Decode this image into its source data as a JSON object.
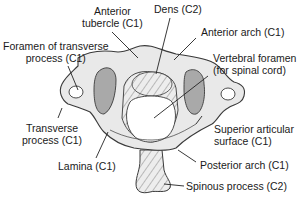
{
  "diagram": {
    "labels": {
      "anterior_tubercle": [
        "Anterior",
        "tubercle (C1)"
      ],
      "dens": [
        "Dens (C2)"
      ],
      "anterior_arch": [
        "Anterior arch (C1)"
      ],
      "foramen_transverse": [
        "Foramen of transverse",
        "process (C1)"
      ],
      "vertebral_foramen": [
        "Vertebral foramen",
        "(for spinal cord)"
      ],
      "transverse_process": [
        "Transverse",
        "process (C1)"
      ],
      "superior_articular": [
        "Superior articular",
        "surface (C1)"
      ],
      "lamina": [
        "Lamina (C1)"
      ],
      "posterior_arch": [
        "Posterior arch (C1)"
      ],
      "spinous_process": [
        "Spinous process (C2)"
      ]
    },
    "colors": {
      "bone_fill": "#e9e9e9",
      "bone_stroke": "#3a3a3a",
      "articular_fill": "#a9a9a9",
      "hatch": "#6a6a6a",
      "text": "#1a1a1a",
      "leader": "#222222"
    }
  }
}
